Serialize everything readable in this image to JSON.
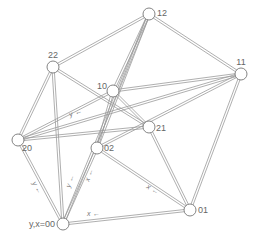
{
  "diagram": {
    "type": "graph",
    "colors": {
      "edge": "#9a9a9a",
      "node_stroke": "#777777",
      "node_fill": "#ffffff",
      "label": "#666666"
    },
    "nodes": [
      {
        "id": "00",
        "label": "y,x=00",
        "x": 63,
        "y": 224
      },
      {
        "id": "01",
        "label": "01",
        "x": 190,
        "y": 210
      },
      {
        "id": "02",
        "label": "02",
        "x": 97,
        "y": 148
      },
      {
        "id": "10",
        "label": "10",
        "x": 113,
        "y": 91
      },
      {
        "id": "11",
        "label": "11",
        "x": 241,
        "y": 74
      },
      {
        "id": "12",
        "label": "12",
        "x": 149,
        "y": 14
      },
      {
        "id": "20",
        "label": "20",
        "x": 18,
        "y": 140
      },
      {
        "id": "21",
        "label": "21",
        "x": 149,
        "y": 127
      },
      {
        "id": "22",
        "label": "22",
        "x": 53,
        "y": 67
      }
    ],
    "edges": [
      {
        "from": "22",
        "to": "12"
      },
      {
        "from": "22",
        "to": "20"
      },
      {
        "from": "22",
        "to": "00"
      },
      {
        "from": "22",
        "to": "21"
      },
      {
        "from": "12",
        "to": "11"
      },
      {
        "from": "12",
        "to": "10"
      },
      {
        "from": "12",
        "to": "02"
      },
      {
        "from": "12",
        "to": "00"
      },
      {
        "from": "10",
        "to": "20"
      },
      {
        "from": "10",
        "to": "11"
      },
      {
        "from": "10",
        "to": "21"
      },
      {
        "from": "10",
        "to": "02"
      },
      {
        "from": "11",
        "to": "20"
      },
      {
        "from": "11",
        "to": "01"
      },
      {
        "from": "11",
        "to": "02"
      },
      {
        "from": "20",
        "to": "00"
      },
      {
        "from": "20",
        "to": "21"
      },
      {
        "from": "21",
        "to": "01"
      },
      {
        "from": "02",
        "to": "01"
      },
      {
        "from": "00",
        "to": "01"
      },
      {
        "from": "00",
        "to": "02"
      }
    ],
    "edge_labels": [
      {
        "text": "y",
        "x": 32,
        "y": 183,
        "rotate": 60
      },
      {
        "text": "y",
        "x": 70,
        "y": 188,
        "rotate": -70
      },
      {
        "text": "x",
        "x": 89,
        "y": 182,
        "rotate": -70
      },
      {
        "text": "x",
        "x": 87,
        "y": 216,
        "rotate": 0
      },
      {
        "text": "x",
        "x": 146,
        "y": 188,
        "rotate": 30
      },
      {
        "text": "y",
        "x": 70,
        "y": 117,
        "rotate": -20
      }
    ]
  }
}
